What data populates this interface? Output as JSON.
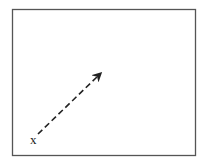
{
  "diagram": {
    "frame": {
      "x": 12,
      "y": 9,
      "width": 184,
      "height": 147,
      "stroke": "#555555"
    },
    "start_label": "x",
    "vector": {
      "x1": 38,
      "y1": 134,
      "x2": 102,
      "y2": 72,
      "style": "dashed",
      "color": "#222222"
    }
  }
}
